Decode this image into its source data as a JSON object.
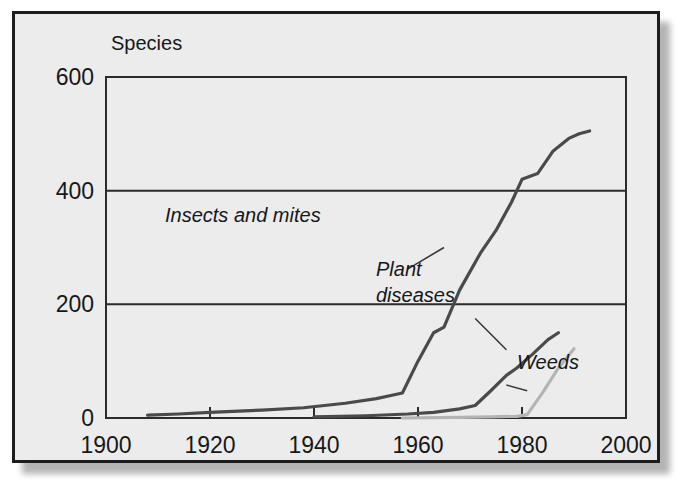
{
  "figure": {
    "background_color": "#ececec",
    "frame_color": "#1d1d1d",
    "has_drop_shadow": true
  },
  "chart_data": {
    "type": "line",
    "title": "",
    "subtitle": "",
    "xlabel": "",
    "ylabel": "Species",
    "ylabel_position": "top-left-above-axis",
    "xlim": [
      1900,
      2000
    ],
    "ylim": [
      0,
      600
    ],
    "xticks": [
      1900,
      1920,
      1940,
      1960,
      1980,
      2000
    ],
    "xtick_labels": [
      "1900",
      "1920",
      "1940",
      "1960",
      "1980",
      "2000"
    ],
    "yticks": [
      0,
      200,
      400,
      600
    ],
    "ytick_labels": [
      "0",
      "200",
      "400",
      "600"
    ],
    "grid": "horizontal-only",
    "gridlines_at": [
      200,
      400
    ],
    "legend": "inline-annotations",
    "series": [
      {
        "name": "Insects and mites",
        "color": "#4a4a4a",
        "line_width": 3.2,
        "label_text": "Insects and mites",
        "label_x": 1942,
        "label_y": 268,
        "leader_from": [
          1958,
          262
        ],
        "leader_to": [
          1965,
          300
        ],
        "x": [
          1908,
          1914,
          1920,
          1930,
          1938,
          1946,
          1952,
          1955,
          1957,
          1960,
          1963,
          1965,
          1968,
          1972,
          1975,
          1978,
          1980,
          1983,
          1986,
          1989,
          1991,
          1993
        ],
        "values": [
          5,
          7,
          10,
          14,
          18,
          26,
          34,
          40,
          44,
          100,
          150,
          160,
          225,
          290,
          330,
          380,
          420,
          430,
          470,
          492,
          500,
          505
        ]
      },
      {
        "name": "Plant diseases",
        "color": "#4a4a4a",
        "line_width": 3.2,
        "label_text_line1": "Plant",
        "label_text_line2": "diseases",
        "label_x": 1966,
        "label_y": 215,
        "leader_from": [
          1971,
          175
        ],
        "leader_to": [
          1977,
          120
        ],
        "x": [
          1940,
          1950,
          1958,
          1963,
          1968,
          1971,
          1974,
          1977,
          1979,
          1982,
          1985,
          1987
        ],
        "values": [
          2,
          4,
          7,
          10,
          16,
          22,
          48,
          75,
          88,
          112,
          138,
          150
        ]
      },
      {
        "name": "Weeds",
        "color": "#b4b4b4",
        "line_width": 3.2,
        "label_text": "Weeds",
        "label_x": 1981,
        "label_y": 58,
        "leader_from": [
          1977,
          58
        ],
        "leader_to": [
          1981,
          48
        ],
        "x": [
          1957,
          1968,
          1974,
          1979,
          1981,
          1984,
          1987,
          1990
        ],
        "values": [
          0,
          1,
          2,
          3,
          6,
          45,
          88,
          122
        ]
      }
    ]
  },
  "annotations": {
    "y_axis_title": "Species",
    "insects_label": "Insects and mites",
    "plant_diseases_label_line1": "Plant",
    "plant_diseases_label_line2": "diseases",
    "weeds_label": "Weeds"
  },
  "axis_labels": {
    "x": [
      "1900",
      "1920",
      "1940",
      "1960",
      "1980",
      "2000"
    ],
    "y": [
      "0",
      "200",
      "400",
      "600"
    ]
  }
}
